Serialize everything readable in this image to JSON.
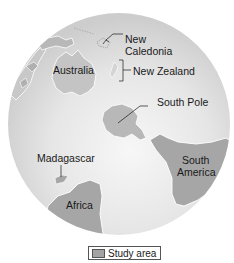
{
  "map": {
    "type": "orthographic-globe",
    "view": "Southern Hemisphere",
    "colors": {
      "ocean": "#e4e4e4",
      "ocean_highlight": "#f4f4f4",
      "land_other": "#cfcfcf",
      "study_area": "#a6a6a6",
      "coast_outline": "#ffffff",
      "text": "#1a1a1a"
    },
    "labels": {
      "new_caledonia": [
        "New",
        "Caledonia"
      ],
      "australia": "Australia",
      "new_zealand": "New Zealand",
      "south_pole": "South Pole",
      "madagascar": "Madagascar",
      "south_america": [
        "South",
        "America"
      ],
      "africa": "Africa"
    }
  },
  "legend": {
    "items": [
      {
        "label": "Study area",
        "swatch_color": "#a6a6a6"
      }
    ]
  }
}
